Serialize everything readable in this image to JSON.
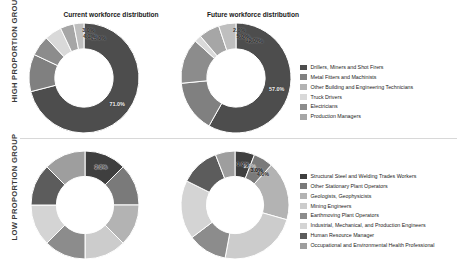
{
  "groups": {
    "high_label": "HIGH PROPORTION GROUP",
    "low_label": "LOW PROPORTION GROUP"
  },
  "titles": {
    "current": "Current workforce distribution",
    "future": "Future workforce distribution"
  },
  "palette": {
    "s1": "#4d4d4d",
    "s2": "#808080",
    "s3": "#b3b3b3",
    "s4": "#d9d9d9",
    "s5": "#8c8c8c",
    "s6": "#a6a6a6",
    "s7": "#737373",
    "s8": "#bfbfbf"
  },
  "legend_high": {
    "items": [
      {
        "label": "Drillers, Miners and Shot Firers",
        "color": "#4d4d4d"
      },
      {
        "label": "Metal Fitters and Machinists",
        "color": "#808080"
      },
      {
        "label": "Other Building and Engineering Technicians",
        "color": "#b3b3b3"
      },
      {
        "label": "Truck Drivers",
        "color": "#d9d9d9"
      },
      {
        "label": "Electricians",
        "color": "#8c8c8c"
      },
      {
        "label": "Production Managers",
        "color": "#a6a6a6"
      }
    ]
  },
  "legend_low": {
    "items": [
      {
        "label": "Structural Steel and Welding Trades Workers",
        "color": "#3f3f3f"
      },
      {
        "label": "Other Stationary Plant Operators",
        "color": "#7a7a7a"
      },
      {
        "label": "Geologists, Geophysicists",
        "color": "#b3b3b3"
      },
      {
        "label": "Mining Engineers",
        "color": "#cccccc"
      },
      {
        "label": "Earthmoving Plant Operators",
        "color": "#8c8c8c"
      },
      {
        "label": "Industrial, Mechanical, and Production Engineers",
        "color": "#d4d4d4"
      },
      {
        "label": "Human Resource Manager",
        "color": "#5c5c5c"
      },
      {
        "label": "Occupational and Environmental Health Professional",
        "color": "#9e9e9e"
      }
    ]
  },
  "chart_data": [
    {
      "type": "pie",
      "id": "high-current",
      "title": "Current workforce distribution",
      "group": "HIGH PROPORTION GROUP",
      "donut": true,
      "unit": "%",
      "legend_position": "right",
      "categories": [
        "Drillers, Miners and Shot Firers",
        "Metal Fitters and Machinists",
        "Other Building and Engineering Technicians",
        "Truck Drivers",
        "Electricians",
        "Production Managers"
      ],
      "values": [
        71,
        11,
        6,
        5,
        4,
        3
      ],
      "labels": [
        "71.0%",
        "11.0%",
        "6.0%",
        "5.0%",
        "4.0%",
        "3.0%"
      ],
      "colors": [
        "#4d4d4d",
        "#808080",
        "#8c8c8c",
        "#d9d9d9",
        "#a6a6a6",
        "#bfbfbf"
      ]
    },
    {
      "type": "pie",
      "id": "high-future",
      "title": "Future workforce distribution",
      "group": "HIGH PROPORTION GROUP",
      "donut": true,
      "unit": "%",
      "legend_position": "right",
      "categories": [
        "Drillers, Miners and Shot Firers",
        "Metal Fitters and Machinists",
        "Other Building and Engineering Technicians",
        "Truck Drivers",
        "Electricians",
        "Production Managers"
      ],
      "values": [
        57,
        15,
        13,
        2,
        6,
        5
      ],
      "labels": [
        "57.0%",
        "15.0%",
        "13.0%",
        "2.0%",
        "6.0%",
        "5.0%"
      ],
      "colors": [
        "#4d4d4d",
        "#808080",
        "#8c8c8c",
        "#d9d9d9",
        "#a6a6a6",
        "#bfbfbf"
      ]
    },
    {
      "type": "pie",
      "id": "low-current",
      "title": "Current workforce distribution",
      "group": "LOW PROPORTION GROUP",
      "donut": true,
      "unit": "%",
      "legend_position": "right",
      "categories": [
        "Structural Steel and Welding Trades Workers",
        "Other Stationary Plant Operators",
        "Geologists, Geophysicists",
        "Mining Engineers",
        "Earthmoving Plant Operators",
        "Industrial, Mechanical, and Production Engineers",
        "Human Resource Manager",
        "Occupational and Environmental Health Professional"
      ],
      "values": [
        2,
        2,
        2,
        2,
        2,
        2,
        2,
        2
      ],
      "labels": [
        "2.0%",
        "2.0%",
        "2.0%",
        "2.0%",
        "2.0%",
        "2.0%",
        "2.0%",
        "2.0%"
      ],
      "colors": [
        "#3f3f3f",
        "#7a7a7a",
        "#b3b3b3",
        "#cccccc",
        "#8c8c8c",
        "#d4d4d4",
        "#5c5c5c",
        "#9e9e9e"
      ]
    },
    {
      "type": "pie",
      "id": "low-future",
      "title": "Future workforce distribution",
      "group": "LOW PROPORTION GROUP",
      "donut": true,
      "unit": "%",
      "legend_position": "right",
      "categories": [
        "Structural Steel and Welding Trades Workers",
        "Other Stationary Plant Operators",
        "Geologists, Geophysicists",
        "Mining Engineers",
        "Earthmoving Plant Operators",
        "Industrial, Mechanical, and Production Engineers",
        "Human Resource Manager",
        "Occupational and Environmental Health Professional"
      ],
      "values": [
        1,
        1,
        3,
        4,
        2,
        3,
        2,
        1
      ],
      "labels": [
        "1.0%",
        "1.0%",
        "3.0%",
        "4.0%",
        "2.0%",
        "3.0%",
        "2.0%",
        "1.0%"
      ],
      "colors": [
        "#3f3f3f",
        "#7a7a7a",
        "#b3b3b3",
        "#cccccc",
        "#8c8c8c",
        "#d4d4d4",
        "#5c5c5c",
        "#9e9e9e"
      ]
    }
  ]
}
